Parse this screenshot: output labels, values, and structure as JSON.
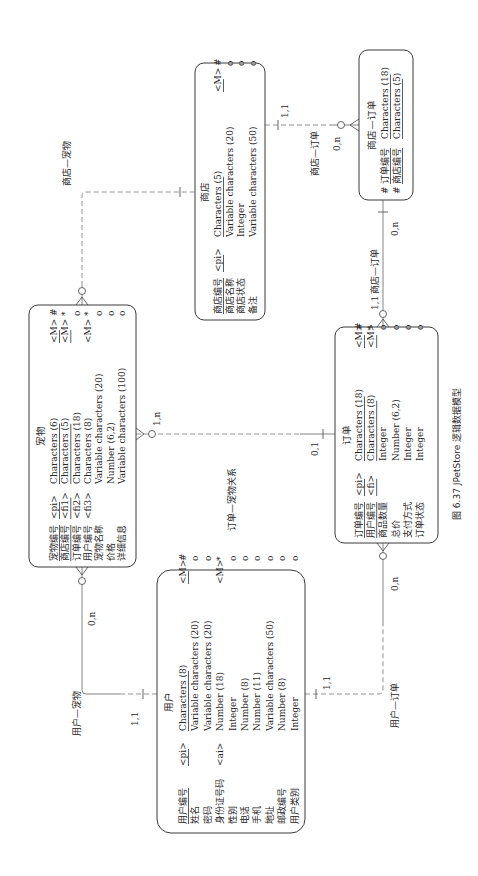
{
  "caption": "图 6.37    JPetStore 逻辑数据模型",
  "entities": {
    "pet": {
      "title": "宠物",
      "rows": [
        {
          "name": "宠物编号",
          "key": "<pi>",
          "type": "Characters (6)",
          "m": "<M>",
          "flag": "#"
        },
        {
          "name": "商店编号",
          "key": "<fi1>",
          "type": "Characters (5)",
          "m": "<M>",
          "flag": "*"
        },
        {
          "name": "订单编号",
          "key": "<fi2>",
          "type": "Characters (18)",
          "m": "",
          "flag": "o"
        },
        {
          "name": "用户编号",
          "key": "<fi3>",
          "type": "Characters (8)",
          "m": "<M>",
          "flag": "*"
        },
        {
          "name": "宠物名称",
          "key": "",
          "type": "Variable characters (20)",
          "m": "",
          "flag": "o"
        },
        {
          "name": "价格",
          "key": "",
          "type": "Number (6,2)",
          "m": "",
          "flag": "o"
        },
        {
          "name": "详细信息",
          "key": "",
          "type": "Variable characters (100)",
          "m": "",
          "flag": "o"
        }
      ]
    },
    "store": {
      "title": "商店",
      "rows": [
        {
          "name": "商店编号",
          "key": "<pi>",
          "type": "Characters (5)",
          "m": "<M>",
          "flag": "#"
        },
        {
          "name": "商店名称",
          "key": "",
          "type": "Variable characters (20)",
          "m": "",
          "flag": "o"
        },
        {
          "name": "商店状态",
          "key": "",
          "type": "Integer",
          "m": "",
          "flag": "o"
        },
        {
          "name": "备注",
          "key": "",
          "type": "Variable characters (50)",
          "m": "",
          "flag": "o"
        }
      ]
    },
    "store_order": {
      "title": "商店—订单",
      "rows": [
        {
          "flag": "#",
          "name": "订单编号",
          "type": "Characters (18)"
        },
        {
          "flag": "#",
          "name": "商店编号",
          "type": "Characters (5)"
        }
      ]
    },
    "order": {
      "title": "订单",
      "rows": [
        {
          "name": "订单编号",
          "key": "<pi>",
          "type": "Characters (18)",
          "m": "<M>",
          "flag": "#"
        },
        {
          "name": "用户编号",
          "key": "<fi>",
          "type": "Characters (8)",
          "m": "<M>",
          "flag": "*"
        },
        {
          "name": "商品数量",
          "key": "",
          "type": "Integer",
          "m": "",
          "flag": "o"
        },
        {
          "name": "总价",
          "key": "",
          "type": "Number (6,2)",
          "m": "",
          "flag": "o"
        },
        {
          "name": "支付方式",
          "key": "",
          "type": "Integer",
          "m": "",
          "flag": "o"
        },
        {
          "name": "订单状态",
          "key": "",
          "type": "Integer",
          "m": "",
          "flag": "o"
        }
      ]
    },
    "user": {
      "title": "用户",
      "rows": [
        {
          "name": "用户编号",
          "key": "<pi>",
          "type": "Characters (8)",
          "m": "<M>",
          "flag": "#"
        },
        {
          "name": "姓名",
          "key": "",
          "type": "Variable characters (20)",
          "m": "",
          "flag": "o"
        },
        {
          "name": "密码",
          "key": "",
          "type": "Variable characters (20)",
          "m": "",
          "flag": "o"
        },
        {
          "name": "身份证号码",
          "key": "<ai>",
          "type": "Number (18)",
          "m": "<M>",
          "flag": "*"
        },
        {
          "name": "性别",
          "key": "",
          "type": "Integer",
          "m": "",
          "flag": "o"
        },
        {
          "name": "电话",
          "key": "",
          "type": "Number (8)",
          "m": "",
          "flag": "o"
        },
        {
          "name": "手机",
          "key": "",
          "type": "Number (11)",
          "m": "",
          "flag": "o"
        },
        {
          "name": "地址",
          "key": "",
          "type": "Variable characters (50)",
          "m": "",
          "flag": "o"
        },
        {
          "name": "邮政编号",
          "key": "",
          "type": "Number (8)",
          "m": "",
          "flag": "o"
        },
        {
          "name": "用户类别",
          "key": "",
          "type": "Integer",
          "m": "",
          "flag": "o"
        }
      ]
    }
  },
  "relationships": {
    "store_pet": {
      "label": "商店—宠物"
    },
    "order_pet": {
      "label": "订单—宠物关系",
      "card_pet": "1,n",
      "card_order": "0,1"
    },
    "store_order_a": {
      "label": "商店—订单",
      "card_store": "1,1",
      "card_link": "0,n"
    },
    "store_order_b": {
      "label": "商店—订单",
      "card_link": "0,n",
      "card_order": "1,1"
    },
    "user_pet": {
      "label": "用户—宠物",
      "card_pet": "0,n",
      "card_user": "1,1"
    },
    "user_order": {
      "label": "用户—订单",
      "card_user": "1,1",
      "card_order": "0,n"
    }
  }
}
